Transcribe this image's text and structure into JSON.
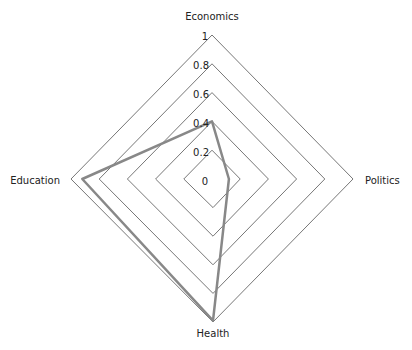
{
  "chart_data": {
    "type": "radar",
    "title": "",
    "axes": [
      "Economics",
      "Politics",
      "Health",
      "Education"
    ],
    "series": [
      {
        "name": "series-1",
        "values": [
          0.4,
          0.12,
          0.99,
          0.92
        ],
        "color": "#888888"
      }
    ],
    "radial_ticks": [
      "0",
      "0.2",
      "0.4",
      "0.6",
      "0.8",
      "1"
    ],
    "rlim": [
      0,
      1
    ],
    "grid": true,
    "legend": null
  },
  "labels": {
    "economics": "Economics",
    "politics": "Politics",
    "health": "Health",
    "education": "Education"
  },
  "ticks": {
    "t0": "0",
    "t1": "0.2",
    "t2": "0.4",
    "t3": "0.6",
    "t4": "0.8",
    "t5": "1"
  }
}
